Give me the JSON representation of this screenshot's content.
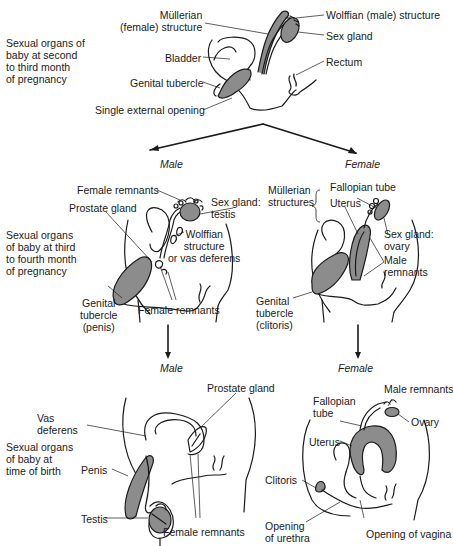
{
  "diagram": {
    "stages": [
      {
        "id": "stage1",
        "text": "Sexual organs of\nbaby at second\nto third month\nof pregnancy"
      },
      {
        "id": "stage2",
        "text": "Sexual organs\nof baby at third\nto fourth month\nof pregnancy"
      },
      {
        "id": "stage3",
        "text": "Sexual organs\nof baby at\ntime of birth"
      }
    ],
    "branches": {
      "male_top": "Male",
      "female_top": "Female",
      "male_bottom": "Male",
      "female_bottom": "Female"
    },
    "panel1_labels": {
      "mullerian": "Müllerian\n(female) structure",
      "wolffian": "Wolffian (male) structure",
      "sex_gland": "Sex gland",
      "bladder": "Bladder",
      "rectum": "Rectum",
      "genital_tubercle": "Genital tubercle",
      "single_opening": "Single external opening"
    },
    "panel2m_labels": {
      "female_remnants_top": "Female remnants",
      "prostate": "Prostate gland",
      "sex_gland_testis": "Sex gland:\ntestis",
      "wolffian_vas": "Wolffian\nstructure\nor vas deferens",
      "genital_tubercle_penis": "Genital\ntubercle\n(penis)",
      "female_remnants_bottom": "Female remnants"
    },
    "panel2f_labels": {
      "mullerian_structures": "Müllerian\nstructures",
      "fallopian_tube": "Fallopian tube",
      "uterus": "Uterus",
      "sex_gland_ovary": "Sex gland:\novary",
      "male_remnants": "Male\nremnants",
      "genital_tubercle_clitoris": "Genital\ntubercle\n(clitoris)"
    },
    "panel3m_labels": {
      "prostate": "Prostate gland",
      "vas_deferens": "Vas\ndeferens",
      "penis": "Penis",
      "testis": "Testis",
      "female_remnants": "Female remnants"
    },
    "panel3f_labels": {
      "male_remnants": "Male remnants",
      "fallopian_tube": "Fallopian\ntube",
      "ovary": "Ovary",
      "uterus": "Uterus",
      "clitoris": "Clitoris",
      "opening_urethra": "Opening\nof urethra",
      "opening_vagina": "Opening of vagina"
    },
    "colors": {
      "line": "#1a1a1a",
      "fill_gray": "#8c8c8c",
      "background": "#ffffff"
    }
  }
}
